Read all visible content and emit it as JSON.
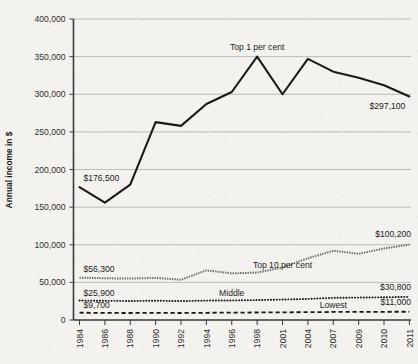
{
  "chart_data": {
    "type": "line",
    "title": "",
    "xlabel": "",
    "ylabel": "Annual income in $",
    "ylim": [
      0,
      400000
    ],
    "grid": true,
    "legend_position": "inline-annotations",
    "categories": [
      "1984",
      "1986",
      "1988",
      "1990",
      "1992",
      "1994",
      "1996",
      "1998",
      "2001",
      "2004",
      "2007",
      "2009",
      "2010",
      "2011"
    ],
    "ytick_labels": [
      "400,000",
      "350,000",
      "300,000",
      "250,000",
      "200,000",
      "150,000",
      "100,000",
      "50,000",
      "0"
    ],
    "ytick_values": [
      400000,
      350000,
      300000,
      250000,
      200000,
      150000,
      100000,
      50000,
      0
    ],
    "series": [
      {
        "name": "Top 1 per cent",
        "style": "solid",
        "color": "#1a1a18",
        "values": [
          176500,
          156000,
          180000,
          263000,
          258000,
          287000,
          303000,
          350000,
          300000,
          347000,
          330000,
          322000,
          312000,
          297100
        ],
        "start_label": "$176,500",
        "end_label": "$297,100"
      },
      {
        "name": "Top 10 per cent",
        "style": "textured",
        "color": "#6e6b66",
        "values": [
          56300,
          55500,
          55000,
          56000,
          53500,
          66000,
          62000,
          63000,
          70000,
          82000,
          92000,
          88000,
          95000,
          100200
        ],
        "start_label": "$56,300",
        "end_label": "$100,200"
      },
      {
        "name": "Middle",
        "style": "dotted",
        "color": "#1a1a18",
        "values": [
          25900,
          25500,
          25300,
          25600,
          25200,
          25800,
          26000,
          26500,
          27200,
          28000,
          29500,
          29800,
          30200,
          30800
        ],
        "start_label": "$25,900",
        "end_label": "$30,800"
      },
      {
        "name": "Lowest",
        "style": "dashed",
        "color": "#1a1a18",
        "values": [
          9700,
          9400,
          9300,
          9500,
          9300,
          9600,
          9800,
          10000,
          10200,
          10400,
          10700,
          10800,
          10900,
          11000
        ],
        "start_label": "$9,700",
        "end_label": "$11,000"
      }
    ],
    "annotations": [
      {
        "text": "Top 1 per cent",
        "series": "Top 1 per cent"
      },
      {
        "text": "Top 10 per cent",
        "series": "Top 10 per cent"
      },
      {
        "text": "Middle",
        "series": "Middle"
      },
      {
        "text": "Lowest",
        "series": "Lowest"
      }
    ]
  }
}
